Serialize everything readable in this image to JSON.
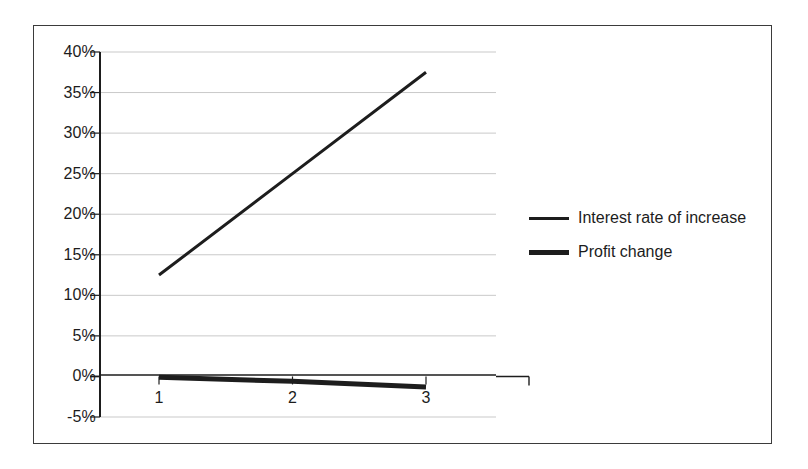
{
  "chart_data": {
    "type": "line",
    "title": "",
    "subtitle": "",
    "xlabel": "",
    "ylabel": "",
    "categories": [
      "1",
      "2",
      "3"
    ],
    "series": [
      {
        "name": "Interest rate of increase",
        "values": [
          12.5,
          25.0,
          37.5
        ],
        "color": "#1d1d1d",
        "line_width": 3
      },
      {
        "name": "Profit change",
        "values": [
          -0.1,
          -0.6,
          -1.3
        ],
        "color": "#1d1d1d",
        "line_width": 5
      }
    ],
    "ylim": [
      -5,
      40
    ],
    "ytick_labels": [
      "40%",
      "35%",
      "30%",
      "25%",
      "20%",
      "15%",
      "10%",
      "5%",
      "0%",
      "-5%"
    ],
    "ytick_values": [
      40,
      35,
      30,
      25,
      20,
      15,
      10,
      5,
      0,
      -5
    ],
    "xtick_labels": [
      "1",
      "2",
      "3"
    ],
    "grid": true,
    "grid_axis": "y",
    "legend_position": "right",
    "axis_line_value": 0,
    "unit": "%"
  },
  "legend": {
    "entries": [
      {
        "label": "Interest rate of increase",
        "style": "thin"
      },
      {
        "label": "Profit change",
        "style": "thick"
      }
    ]
  },
  "colors": {
    "border": "#3b3b3b",
    "axis": "#1d1d1d",
    "grid": "#c9c9c9",
    "series": "#1d1d1d",
    "background": "#ffffff",
    "text": "#1c1c1c"
  }
}
